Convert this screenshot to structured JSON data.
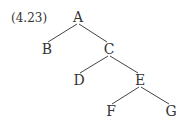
{
  "example_number": "(4.23)",
  "tree": {
    "nodes": [
      {
        "id": "A",
        "label": "A",
        "x": 78,
        "y": 17
      },
      {
        "id": "B",
        "label": "B",
        "x": 47,
        "y": 49
      },
      {
        "id": "C",
        "label": "C",
        "x": 109,
        "y": 49
      },
      {
        "id": "D",
        "label": "D",
        "x": 79,
        "y": 80
      },
      {
        "id": "E",
        "label": "E",
        "x": 140,
        "y": 80
      },
      {
        "id": "F",
        "label": "F",
        "x": 111,
        "y": 111
      },
      {
        "id": "G",
        "label": "G",
        "x": 171,
        "y": 111
      }
    ],
    "edges": [
      {
        "from": "A",
        "to": "B"
      },
      {
        "from": "A",
        "to": "C"
      },
      {
        "from": "C",
        "to": "D"
      },
      {
        "from": "C",
        "to": "E"
      },
      {
        "from": "E",
        "to": "F"
      },
      {
        "from": "E",
        "to": "G"
      }
    ]
  },
  "colors": {
    "ink": "#333333",
    "background": "#ffffff"
  }
}
